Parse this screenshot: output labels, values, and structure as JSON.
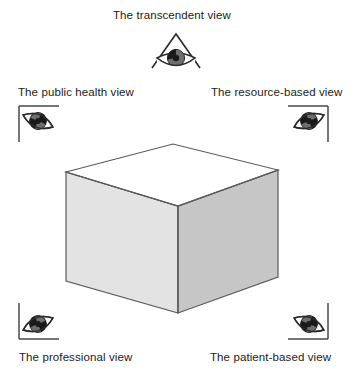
{
  "figure": {
    "title_present": false,
    "background_color": "#ffffff",
    "width": 353,
    "height": 375
  },
  "labels": {
    "transcendent": "The transcendent view",
    "public_health": "The public health view",
    "resource_based": "The resource-based view",
    "professional": "The professional view",
    "patient_based": "The patient-based view"
  },
  "icons": {
    "transcendent": "eye-in-peak-icon",
    "public_health": "eye-in-corner-bracket-top-left-icon",
    "resource_based": "eye-in-corner-bracket-top-right-icon",
    "professional": "eye-in-corner-bracket-bottom-left-icon",
    "patient_based": "eye-in-corner-bracket-bottom-right-icon",
    "center": "isometric-cube-icon"
  },
  "cube": {
    "top_face_color": "#ffffff",
    "left_face_color": "#e3e3e3",
    "right_face_color": "#c6c6c6",
    "outline_color": "#5a5a5a"
  },
  "eye": {
    "sclera_color": "#ffffff",
    "iris_color": "#6e6e6e",
    "pupil_color": "#1a1a1a",
    "outline_color": "#2b2b2b",
    "bracket_color": "#4a4a4a"
  }
}
